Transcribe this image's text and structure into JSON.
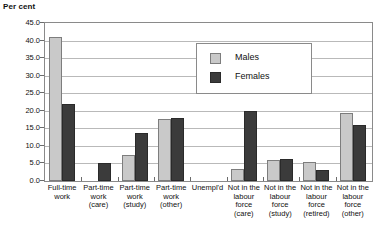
{
  "chart_data": {
    "type": "bar",
    "title": "",
    "ylabel": "Per cent",
    "xlabel": "",
    "ylim": [
      0.0,
      45.0
    ],
    "ytick_step": 5.0,
    "ytick_labels": [
      "45.0",
      "40.0",
      "35.0",
      "30.0",
      "25.0",
      "20.0",
      "15.0",
      "10.0",
      "5.0",
      "0.0"
    ],
    "ytick_values": [
      45.0,
      40.0,
      35.0,
      30.0,
      25.0,
      20.0,
      15.0,
      10.0,
      5.0,
      0.0
    ],
    "grid": true,
    "legend_position": "upper-center",
    "categories": [
      [
        "Full-time",
        "work"
      ],
      [
        "Part-time",
        "work",
        "(care)"
      ],
      [
        "Part-time",
        "work",
        "(study)"
      ],
      [
        "Part-time",
        "work",
        "(other)"
      ],
      [
        "Unempl'd"
      ],
      [
        "Not in the",
        "labour",
        "force",
        "(care)"
      ],
      [
        "Not in the",
        "labour",
        "force",
        "(study)"
      ],
      [
        "Not in the",
        "labour",
        "force",
        "(retired)"
      ],
      [
        "Not in the",
        "labour",
        "force",
        "(other)"
      ]
    ],
    "category_labels_flat": [
      "Full-time work",
      "Part-time work (care)",
      "Part-time work (study)",
      "Part-time work (other)",
      "Unempl'd",
      "Not in the labour force (care)",
      "Not in the labour force (study)",
      "Not in the labour force (retired)",
      "Not in the labour force (other)"
    ],
    "series": [
      {
        "name": "Males",
        "color": "#c9c9c9",
        "values": [
          41.0,
          0.0,
          7.5,
          17.8,
          0.0,
          3.5,
          6.0,
          5.5,
          19.5
        ]
      },
      {
        "name": "Females",
        "color": "#3b3b3b",
        "values": [
          22.0,
          5.0,
          13.8,
          18.0,
          0.0,
          20.0,
          6.2,
          3.0,
          16.0
        ]
      }
    ]
  },
  "legend": {
    "items": [
      {
        "label": "Males"
      },
      {
        "label": "Females"
      }
    ]
  },
  "colors": {
    "males": "#c9c9c9",
    "females": "#3b3b3b",
    "grid": "#b9b9b9",
    "axis": "#8a8a8a",
    "text": "#111111",
    "background": "#ffffff"
  }
}
